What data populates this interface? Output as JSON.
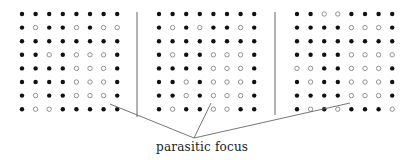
{
  "diagram": {
    "label": "parasitic focus",
    "legend": {
      "filled": "filled dot",
      "hollow": "hollow dot"
    },
    "colors": {
      "filled": "#111111",
      "hollow_stroke": "#777777",
      "line": "#666666",
      "text": "#222222"
    },
    "grid": {
      "rows": 8,
      "cols": 8,
      "spacing": 13.6,
      "dot_radius_filled": 2.2,
      "dot_radius_hollow": 2.2,
      "row_y0": 14
    },
    "panels": [
      {
        "name": "left-panel",
        "x0": 22,
        "rows": [
          "11111111",
          "10110100",
          "11111111",
          "11010001",
          "11110001",
          "11110001",
          "10110001",
          "10011111"
        ]
      },
      {
        "name": "middle-panel",
        "x0": 159,
        "rows": [
          "11111111",
          "10101101",
          "11111111",
          "10110001",
          "11110001",
          "11010001",
          "11010001",
          "10110011"
        ]
      },
      {
        "name": "right-panel",
        "x0": 297,
        "rows": [
          "11001111",
          "11110001",
          "11111111",
          "11110000",
          "00110001",
          "10110001",
          "11110001",
          "10101110"
        ]
      }
    ],
    "dividers": [
      {
        "x": 137,
        "y1": 12,
        "y2": 117
      },
      {
        "x": 275,
        "y1": 12,
        "y2": 115
      }
    ],
    "leaders": [
      {
        "x1": 194,
        "y1": 138,
        "x2": 110,
        "y2": 104
      },
      {
        "x1": 194,
        "y1": 138,
        "x2": 211,
        "y2": 103
      },
      {
        "x1": 194,
        "y1": 138,
        "x2": 350,
        "y2": 103
      }
    ],
    "label_pos": {
      "x": 156,
      "y": 140
    }
  }
}
